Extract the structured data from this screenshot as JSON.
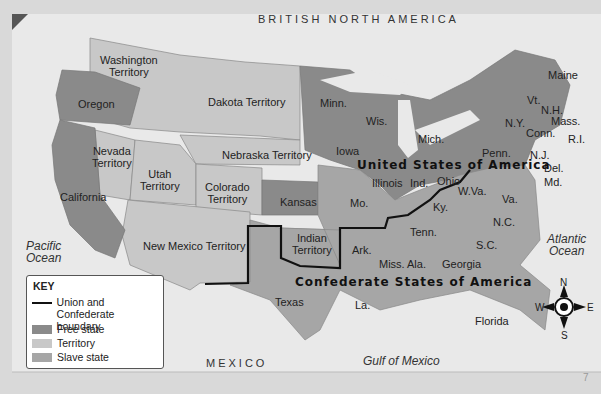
{
  "map": {
    "colors": {
      "free_state": "#8a8a8a",
      "territory": "#c8c8c8",
      "slave_state": "#a6a6a6",
      "water": "#e8e8e8",
      "boundary": "#111111"
    },
    "region_labels": {
      "british_north_america": "BRITISH NORTH AMERICA",
      "mexico": "MEXICO",
      "pacific": "Pacific\nOcean",
      "pacific_l1": "Pacific",
      "pacific_l2": "Ocean",
      "atlantic_l1": "Atlantic",
      "atlantic_l2": "Ocean",
      "gulf": "Gulf of Mexico",
      "usa": "United States of America",
      "csa": "Confederate States of America"
    },
    "territories": [
      "Washington Territory",
      "Dakota Territory",
      "Nebraska Territory",
      "Nevada Territory",
      "Utah Territory",
      "Colorado Territory",
      "New Mexico Territory",
      "Indian Territory"
    ],
    "free_states": [
      "Oregon",
      "California",
      "Kansas",
      "Minn.",
      "Iowa",
      "Wis.",
      "Mich.",
      "Illinois",
      "Ind.",
      "Ohio",
      "Penn.",
      "N.Y.",
      "Vt.",
      "N.H.",
      "Maine",
      "Mass.",
      "Conn.",
      "R.I.",
      "N.J."
    ],
    "slave_states": [
      "Mo.",
      "Ky.",
      "W.Va.",
      "Va.",
      "Del.",
      "Md.",
      "N.C.",
      "Tenn.",
      "S.C.",
      "Ark.",
      "Miss.",
      "Ala.",
      "Georgia",
      "La.",
      "Texas",
      "Florida"
    ],
    "labels": {
      "washington_1": "Washington",
      "washington_2": "Territory",
      "oregon": "Oregon",
      "dakota": "Dakota Territory",
      "nevada_1": "Nevada",
      "nevada_2": "Territory",
      "utah_1": "Utah",
      "utah_2": "Territory",
      "nebraska": "Nebraska Territory",
      "colorado_1": "Colorado",
      "colorado_2": "Territory",
      "california": "California",
      "kansas": "Kansas",
      "new_mexico": "New Mexico Territory",
      "indian_1": "Indian",
      "indian_2": "Territory",
      "texas": "Texas",
      "minn": "Minn.",
      "iowa": "Iowa",
      "wis": "Wis.",
      "mich": "Mich.",
      "illinois": "Illinois",
      "ind": "Ind.",
      "ohio": "Ohio",
      "mo": "Mo.",
      "ky": "Ky.",
      "wva": "W.Va.",
      "va": "Va.",
      "penn": "Penn.",
      "ny": "N.Y.",
      "vt": "Vt.",
      "nh": "N.H.",
      "maine": "Maine",
      "mass": "Mass.",
      "conn": "Conn.",
      "ri": "R.I.",
      "nj": "N.J.",
      "del": "Del.",
      "md": "Md.",
      "nc": "N.C.",
      "tenn": "Tenn.",
      "sc": "S.C.",
      "ark": "Ark.",
      "miss": "Miss.",
      "ala": "Ala.",
      "georgia": "Georgia",
      "la": "La.",
      "florida": "Florida"
    },
    "compass": {
      "n": "N",
      "s": "S",
      "e": "E",
      "w": "W"
    },
    "page_number": "7"
  },
  "key": {
    "title": "KEY",
    "items": [
      {
        "label": "Union and Confederate",
        "label2": "boundary"
      },
      {
        "label": "Free state"
      },
      {
        "label": "Territory"
      },
      {
        "label": "Slave state"
      }
    ]
  }
}
